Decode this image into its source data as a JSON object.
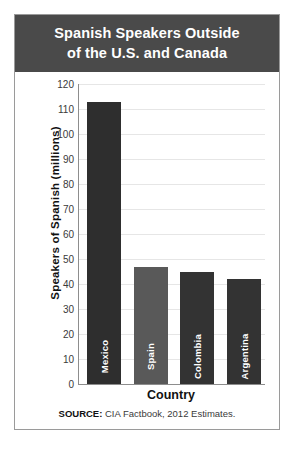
{
  "title": {
    "line1": "Spanish Speakers Outside",
    "line2": "of the U.S. and Canada"
  },
  "source": {
    "prefix": "SOURCE:",
    "text": " CIA Factbook, 2012 Estimates."
  },
  "colors": {
    "banner": "#4a4a4a",
    "bar_dark": "#2e2e2e",
    "bar_mid": "#595959",
    "grid": "#e6e6e6",
    "axis": "#8d8d8d",
    "frame": "#9a9a9a"
  },
  "chart_data": {
    "type": "bar",
    "title": "Spanish Speakers Outside of the U.S. and Canada",
    "xlabel": "Country",
    "ylabel": "Speakers of Spanish (millions)",
    "categories": [
      "Mexico",
      "Spain",
      "Colombia",
      "Argentina"
    ],
    "values": [
      113,
      47,
      45,
      42
    ],
    "bar_colors": [
      "#2e2e2e",
      "#595959",
      "#333333",
      "#333333"
    ],
    "ylim": [
      0,
      120
    ],
    "ytick_step": 10,
    "yticks": [
      0,
      10,
      20,
      30,
      40,
      50,
      60,
      70,
      80,
      90,
      100,
      110,
      120
    ],
    "ytick_labels": [
      "0",
      "10",
      "20",
      "30",
      "40",
      "50",
      "60",
      "70",
      "80",
      "90",
      "100",
      "110",
      "120"
    ],
    "grid": true,
    "legend": null,
    "source_note": "SOURCE: CIA Factbook, 2012 Estimates."
  }
}
